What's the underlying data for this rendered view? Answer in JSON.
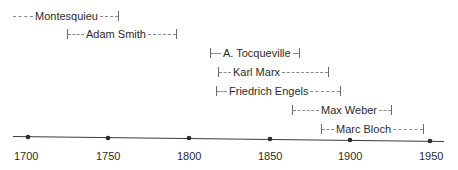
{
  "timeline": {
    "axis": {
      "start_year": 1700,
      "end_year": 1950,
      "ticks": [
        {
          "label": "1700",
          "x": 28,
          "y": 137,
          "label_x": 14
        },
        {
          "label": "1750",
          "x": 108,
          "y": 138,
          "label_x": 96
        },
        {
          "label": "1800",
          "x": 189,
          "y": 138,
          "label_x": 177
        },
        {
          "label": "1850",
          "x": 270,
          "y": 139,
          "label_x": 258
        },
        {
          "label": "1900",
          "x": 350,
          "y": 140,
          "label_x": 338
        },
        {
          "label": "1950",
          "x": 430,
          "y": 141,
          "label_x": 419
        }
      ]
    },
    "thinkers": [
      {
        "name": "Montesquieu",
        "left_tick": false,
        "x": 13,
        "y": 9,
        "lead": 20,
        "trail": 18
      },
      {
        "name": "Adam Smith",
        "left_tick": true,
        "x": 67,
        "y": 27,
        "lead": 16,
        "trail": 28
      },
      {
        "name": "A. Tocqueville",
        "left_tick": true,
        "x": 210,
        "y": 46,
        "lead": 10,
        "trail": 6
      },
      {
        "name": "Karl Marx",
        "left_tick": true,
        "x": 218,
        "y": 65,
        "lead": 12,
        "trail": 46
      },
      {
        "name": "Friedrich Engels",
        "left_tick": true,
        "x": 216,
        "y": 84,
        "lead": 10,
        "trail": 30
      },
      {
        "name": "Max Weber",
        "left_tick": true,
        "x": 292,
        "y": 103,
        "lead": 26,
        "trail": 12
      },
      {
        "name": "Marc Bloch",
        "left_tick": true,
        "x": 321,
        "y": 122,
        "lead": 12,
        "trail": 30
      }
    ]
  }
}
